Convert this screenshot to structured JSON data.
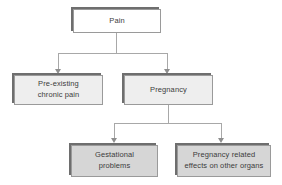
{
  "diagram": {
    "colors": {
      "root_fill": "#ffffff",
      "level1_fill": "#eeeeee",
      "level2_fill": "#d6d6d6",
      "border": "#9a9a9a",
      "shadow": "#6e6e6e",
      "connector": "#a8a8a8",
      "text": "#3c3c3c",
      "background": "#ffffff"
    },
    "nodes": [
      {
        "id": "pain",
        "label": "Pain",
        "level": 0
      },
      {
        "id": "pre-existing",
        "label": "Pre-existing\nchronic pain",
        "level": 1
      },
      {
        "id": "pregnancy",
        "label": "Pregnancy",
        "level": 1
      },
      {
        "id": "gestational",
        "label": "Gestational\nproblems",
        "level": 2
      },
      {
        "id": "pregnancy-effects",
        "label": "Pregnancy related\neffects on other organs",
        "level": 2
      }
    ],
    "edges": [
      {
        "from": "pain",
        "to": "pre-existing"
      },
      {
        "from": "pain",
        "to": "pregnancy"
      },
      {
        "from": "pregnancy",
        "to": "gestational"
      },
      {
        "from": "pregnancy",
        "to": "pregnancy-effects"
      }
    ]
  }
}
